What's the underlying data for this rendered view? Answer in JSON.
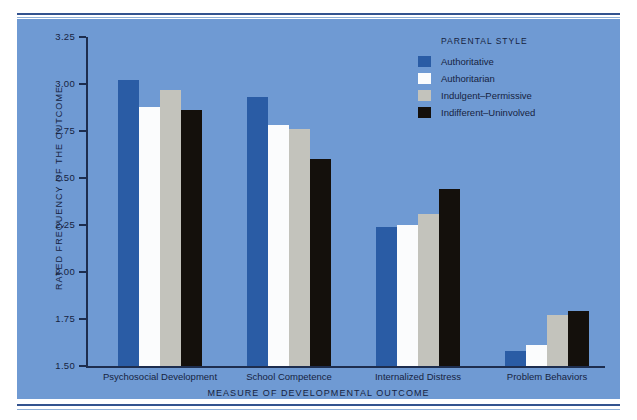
{
  "chart_data": {
    "type": "bar",
    "title": "",
    "xlabel": "MEASURE OF DEVELOPMENTAL OUTCOME",
    "ylabel": "RATED FREQUENCY OF THE OUTCOME",
    "ylim": [
      1.5,
      3.25
    ],
    "yticks": [
      "1.50",
      "1.75",
      "2.00",
      "2.25",
      "2.50",
      "2.75",
      "3.00",
      "3.25"
    ],
    "grid": false,
    "legend_position": "top-right",
    "legend_title": "PARENTAL STYLE",
    "categories": [
      "Psychosocial Development",
      "School Competence",
      "Internalized Distress",
      "Problem Behaviors"
    ],
    "series": [
      {
        "name": "Authoritative",
        "color": "#2a5ca5",
        "values": [
          3.02,
          2.93,
          2.24,
          1.58
        ]
      },
      {
        "name": "Authoritarian",
        "color": "#fbfcfd",
        "values": [
          2.88,
          2.78,
          2.25,
          1.61
        ]
      },
      {
        "name": "Indulgent–Permissive",
        "color": "#c3c3bc",
        "values": [
          2.97,
          2.76,
          2.31,
          1.77
        ]
      },
      {
        "name": "Indifferent–Uninvolved",
        "color": "#14100c",
        "values": [
          2.86,
          2.6,
          2.44,
          1.79
        ]
      }
    ]
  },
  "figure": {
    "panel_color": "#6f9ad3",
    "rule_color": "#33538f",
    "axis_color": "#1d2d4e",
    "text_color": "#16233f"
  }
}
